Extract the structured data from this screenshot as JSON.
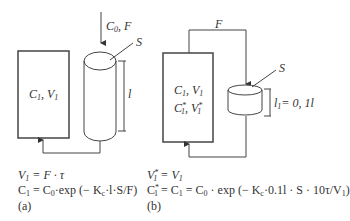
{
  "diagram": {
    "a": {
      "inlet_label": "C0, F",
      "inlet_c": "C",
      "inlet_c_sub": "0",
      "inlet_f": ", F",
      "surface_label": "S",
      "length_label": "l",
      "tank_c": "C",
      "tank_c_sub": "1",
      "tank_v": ", V",
      "tank_v_sub": "1",
      "eq1": {
        "lhs": "V",
        "lhs_sub": "1",
        "rhs": " = F · τ"
      },
      "eq2": {
        "c1": "C",
        "c1_sub": "1",
        "mid": " = C",
        "mid_sub": "0",
        "rest": "·exp (− K",
        "kc_sub": "c",
        "tail": "·l·S/F)"
      },
      "panel_label": "(a)"
    },
    "b": {
      "flow_label": "F",
      "surface_label": "S",
      "length_label": "l",
      "length_sub": "1",
      "length_value": "= 0, 1l",
      "tank_line1_c": "C",
      "tank_line1_c_sub": "1",
      "tank_line1_v": ", V",
      "tank_line1_v_sub": "1",
      "tank_line2_c": "C",
      "tank_line2_c_sub": "1",
      "tank_line2_v": ", V",
      "tank_line2_v_sub": "1",
      "star": "*",
      "eq1": {
        "lhs": "V",
        "lhs_sub": "1",
        "rhs": " = V",
        "rhs_sub": "1"
      },
      "eq2": {
        "a": "C",
        "a_sub": "1",
        "b": " = C",
        "b_sub": "1",
        "c": " = C",
        "c_sub": "0",
        "rest": " · exp (− K",
        "kc_sub": "c",
        "tail": "·0.1l · S · 10τ/V",
        "tail_sub": "1",
        "close": ")"
      },
      "panel_label": "(b)"
    }
  }
}
